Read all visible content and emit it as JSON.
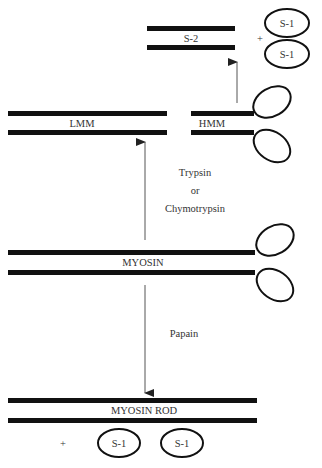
{
  "diagram": {
    "fragments": {
      "s2": {
        "label": "S-2"
      },
      "plus_top": {
        "label": "+"
      },
      "s1_top_1": {
        "label": "S-1"
      },
      "s1_top_2": {
        "label": "S-1"
      },
      "lmm": {
        "label": "LMM"
      },
      "hmm": {
        "label": "HMM"
      },
      "myosin": {
        "label": "MYOSIN"
      },
      "myosin_rod": {
        "label": "MYOSIN ROD"
      },
      "plus_bottom": {
        "label": "+"
      },
      "s1_bottom_1": {
        "label": "S-1"
      },
      "s1_bottom_2": {
        "label": "S-1"
      }
    },
    "enzymes": {
      "upper": {
        "line1": "Trypsin",
        "line2": "or",
        "line3": "Chymotrypsin"
      },
      "lower": {
        "line1": "Papain"
      }
    },
    "colors": {
      "ink": "#111111",
      "text": "#333333",
      "arrow": "#555555",
      "background": "#ffffff"
    }
  }
}
